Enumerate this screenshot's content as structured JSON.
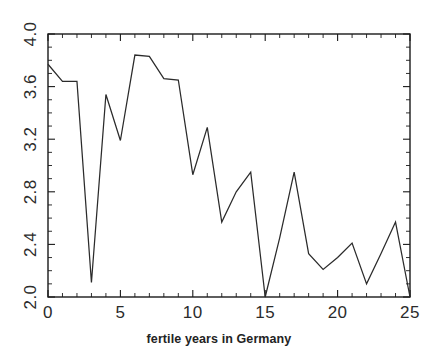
{
  "chart_data": {
    "type": "line",
    "title": "",
    "xlabel": "fertile years in Germany",
    "ylabel": "",
    "xlim": [
      0,
      25
    ],
    "ylim": [
      2.0,
      4.0
    ],
    "xticks": [
      0,
      5,
      10,
      15,
      20,
      25
    ],
    "xtick_labels": [
      "0",
      "5",
      "10",
      "15",
      "20",
      "25"
    ],
    "yticks": [
      2.0,
      2.4,
      2.8,
      3.2,
      3.6,
      4.0
    ],
    "ytick_labels": [
      "2.0",
      "2.4",
      "2.8",
      "3.2",
      "3.6",
      "4.0"
    ],
    "grid": false,
    "legend": false,
    "x": [
      0,
      1,
      2,
      3,
      4,
      5,
      6,
      7,
      8,
      9,
      10,
      11,
      12,
      13,
      14,
      15,
      16,
      17,
      18,
      19,
      20,
      21,
      22,
      23,
      24,
      25
    ],
    "values": [
      3.77,
      3.64,
      3.64,
      2.11,
      3.54,
      3.19,
      3.84,
      3.83,
      3.66,
      3.65,
      2.93,
      3.29,
      2.57,
      2.8,
      2.95,
      2.0,
      2.45,
      2.95,
      2.33,
      2.21,
      2.3,
      2.41,
      2.1,
      2.33,
      2.57,
      2.0
    ],
    "series_name": "fertility rate",
    "line_color": "#2b2b2b",
    "background_color": "#ffffff"
  },
  "axes": {
    "x_axis_name": "x-axis",
    "y_axis_name": "y-axis"
  }
}
